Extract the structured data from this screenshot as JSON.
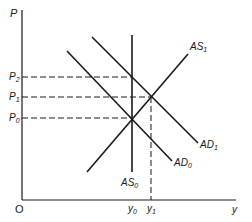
{
  "diagram": {
    "type": "AS-AD economics diagram",
    "axes": {
      "y_label": "P",
      "x_label": "y",
      "origin_label": "O"
    },
    "price_levels": [
      {
        "base": "P",
        "sub": "2",
        "y": 77
      },
      {
        "base": "P",
        "sub": "1",
        "y": 97
      },
      {
        "base": "P",
        "sub": "0",
        "y": 118
      }
    ],
    "output_levels": [
      {
        "base": "y",
        "sub": "0",
        "x": 132
      },
      {
        "base": "y",
        "sub": "1",
        "x": 151
      }
    ],
    "curves": {
      "AS0": {
        "base": "AS",
        "sub": "0",
        "kind": "vertical"
      },
      "AS1": {
        "base": "AS",
        "sub": "1",
        "kind": "upward-sloping"
      },
      "AD0": {
        "base": "AD",
        "sub": "0",
        "kind": "downward-sloping"
      },
      "AD1": {
        "base": "AD",
        "sub": "1",
        "kind": "downward-sloping"
      }
    },
    "colors": {
      "line": "#1a1a1a",
      "background": "#ffffff"
    }
  }
}
